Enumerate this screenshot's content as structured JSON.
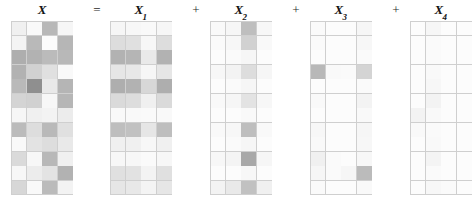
{
  "figure": {
    "kind": "matrix-decomposition-diagram",
    "background": "#ffffff",
    "grid_line_color": "#cfcfcf",
    "base_color": "#ffffff",
    "dark_color": "#6e6e6e",
    "rows": 12,
    "cols": 4
  },
  "terms": [
    {
      "id": "X",
      "label": "X",
      "subscript": "",
      "x": 11,
      "width": 62
    },
    {
      "id": "X1",
      "label": "X",
      "subscript": "1",
      "x": 110,
      "width": 62
    },
    {
      "id": "X2",
      "label": "X",
      "subscript": "2",
      "x": 210,
      "width": 62
    },
    {
      "id": "X3",
      "label": "X",
      "subscript": "3",
      "x": 310,
      "width": 62
    },
    {
      "id": "X4",
      "label": "X",
      "subscript": "4",
      "x": 410,
      "width": 62
    }
  ],
  "operators": [
    {
      "id": "equals",
      "symbol": "=",
      "x": 88
    },
    {
      "id": "plus1",
      "symbol": "+",
      "x": 187
    },
    {
      "id": "plus2",
      "symbol": "+",
      "x": 287
    },
    {
      "id": "plus3",
      "symbol": "+",
      "x": 387
    }
  ],
  "chart_data": {
    "type": "heatmap",
    "title": "",
    "xlabel": "",
    "ylabel": "",
    "colormap": "grayscale-inverted",
    "vmin": 0,
    "vmax": 1,
    "note": "X = X1 + X2 + X3 + X4 ; each panel is a 12x4 grayscale heatmap where 0 = white and 1 = dark gray",
    "panels": [
      {
        "name": "X",
        "rows": 12,
        "cols": 4,
        "values": [
          [
            0.1,
            0.04,
            0.46,
            0.06
          ],
          [
            0.07,
            0.45,
            0.02,
            0.47
          ],
          [
            0.52,
            0.5,
            0.44,
            0.46
          ],
          [
            0.5,
            0.3,
            0.2,
            0.04
          ],
          [
            0.45,
            0.72,
            0.14,
            0.48
          ],
          [
            0.28,
            0.3,
            0.05,
            0.47
          ],
          [
            0.06,
            0.1,
            0.08,
            0.12
          ],
          [
            0.44,
            0.22,
            0.45,
            0.2
          ],
          [
            0.04,
            0.18,
            0.22,
            0.14
          ],
          [
            0.24,
            0.05,
            0.46,
            0.1
          ],
          [
            0.05,
            0.12,
            0.18,
            0.5
          ],
          [
            0.26,
            0.04,
            0.44,
            0.08
          ]
        ]
      },
      {
        "name": "X1",
        "rows": 12,
        "cols": 4,
        "values": [
          [
            0.06,
            0.05,
            0.04,
            0.06
          ],
          [
            0.22,
            0.2,
            0.05,
            0.22
          ],
          [
            0.5,
            0.48,
            0.14,
            0.5
          ],
          [
            0.16,
            0.15,
            0.06,
            0.16
          ],
          [
            0.52,
            0.5,
            0.26,
            0.52
          ],
          [
            0.24,
            0.22,
            0.1,
            0.24
          ],
          [
            0.04,
            0.04,
            0.03,
            0.04
          ],
          [
            0.42,
            0.4,
            0.16,
            0.42
          ],
          [
            0.1,
            0.1,
            0.05,
            0.1
          ],
          [
            0.05,
            0.05,
            0.03,
            0.05
          ],
          [
            0.2,
            0.19,
            0.08,
            0.2
          ],
          [
            0.16,
            0.15,
            0.07,
            0.16
          ]
        ]
      },
      {
        "name": "X2",
        "rows": 12,
        "cols": 4,
        "values": [
          [
            0.04,
            0.06,
            0.42,
            0.05
          ],
          [
            0.03,
            0.05,
            0.3,
            0.04
          ],
          [
            0.02,
            0.03,
            0.06,
            0.02
          ],
          [
            0.05,
            0.08,
            0.22,
            0.06
          ],
          [
            0.02,
            0.03,
            0.06,
            0.02
          ],
          [
            0.04,
            0.06,
            0.18,
            0.05
          ],
          [
            0.02,
            0.02,
            0.04,
            0.02
          ],
          [
            0.04,
            0.05,
            0.42,
            0.04
          ],
          [
            0.02,
            0.03,
            0.06,
            0.02
          ],
          [
            0.05,
            0.07,
            0.56,
            0.06
          ],
          [
            0.02,
            0.02,
            0.05,
            0.02
          ],
          [
            0.08,
            0.14,
            0.4,
            0.1
          ]
        ]
      },
      {
        "name": "X3",
        "rows": 12,
        "cols": 4,
        "values": [
          [
            0.03,
            0.02,
            0.02,
            0.06
          ],
          [
            0.03,
            0.02,
            0.02,
            0.05
          ],
          [
            0.02,
            0.02,
            0.02,
            0.03
          ],
          [
            0.46,
            0.04,
            0.03,
            0.28
          ],
          [
            0.02,
            0.02,
            0.02,
            0.03
          ],
          [
            0.04,
            0.02,
            0.02,
            0.08
          ],
          [
            0.02,
            0.02,
            0.02,
            0.04
          ],
          [
            0.05,
            0.02,
            0.02,
            0.06
          ],
          [
            0.04,
            0.02,
            0.02,
            0.05
          ],
          [
            0.1,
            0.03,
            0.02,
            0.05
          ],
          [
            0.06,
            0.03,
            0.06,
            0.44
          ],
          [
            0.03,
            0.02,
            0.02,
            0.04
          ]
        ]
      },
      {
        "name": "X4",
        "rows": 12,
        "cols": 4,
        "values": [
          [
            0.02,
            0.06,
            0.02,
            0.02
          ],
          [
            0.02,
            0.03,
            0.02,
            0.02
          ],
          [
            0.02,
            0.03,
            0.02,
            0.02
          ],
          [
            0.02,
            0.04,
            0.02,
            0.02
          ],
          [
            0.02,
            0.05,
            0.02,
            0.02
          ],
          [
            0.02,
            0.08,
            0.02,
            0.02
          ],
          [
            0.08,
            0.04,
            0.02,
            0.02
          ],
          [
            0.04,
            0.03,
            0.02,
            0.02
          ],
          [
            0.02,
            0.04,
            0.02,
            0.02
          ],
          [
            0.02,
            0.07,
            0.02,
            0.02
          ],
          [
            0.02,
            0.03,
            0.02,
            0.02
          ],
          [
            0.02,
            0.05,
            0.03,
            0.02
          ]
        ]
      }
    ]
  }
}
